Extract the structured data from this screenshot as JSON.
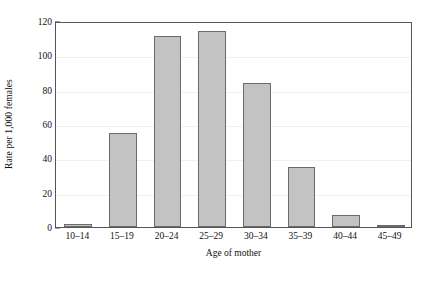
{
  "chart_data": {
    "type": "bar",
    "title": "",
    "xlabel": "Age of mother",
    "ylabel": "Rate per 1,000 females",
    "categories": [
      "10–14",
      "15–19",
      "20–24",
      "25–29",
      "30–34",
      "35–39",
      "40–44",
      "45–49"
    ],
    "values": [
      1.5,
      55,
      111,
      114,
      84,
      35,
      7,
      0.6
    ],
    "ylim": [
      0,
      120
    ],
    "ytick_labels": [
      "0",
      "20",
      "40",
      "60",
      "80",
      "100",
      "120"
    ],
    "ytick_values": [
      0,
      20,
      40,
      60,
      80,
      100,
      120
    ],
    "yminor_values": [
      10,
      30,
      50,
      70,
      90,
      110
    ],
    "grid": true,
    "legend": "none",
    "bar_fill_color": "#c3c3c3",
    "bar_edge_color": "#6b6b6b",
    "frame_color": "#555555",
    "gridline_color": "#f0f0f0",
    "text_color": "#111111",
    "background_color": "#ffffff"
  }
}
